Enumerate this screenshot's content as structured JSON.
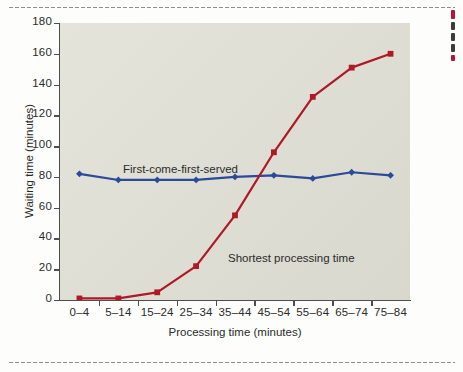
{
  "figure": {
    "plot_bg_color": "#dfdfd4",
    "page_bg_color": "#fdfdfb",
    "axis_color": "#4d4d4d"
  },
  "chart_data": {
    "type": "line",
    "title": "",
    "xlabel": "Processing time (minutes)",
    "ylabel": "Waiting time (minutes)",
    "categories": [
      "0–4",
      "5–14",
      "15–24",
      "25–34",
      "35–44",
      "45–54",
      "55–64",
      "65–74",
      "75–84"
    ],
    "yticks": [
      0,
      20,
      40,
      60,
      80,
      100,
      120,
      140,
      160,
      180
    ],
    "ylim": [
      0,
      180
    ],
    "grid": false,
    "legend_position": "inline-annotations",
    "series": [
      {
        "name": "First-come-first-served",
        "color": "#2a4a9a",
        "marker": "diamond",
        "values": [
          82,
          78,
          78,
          78,
          80,
          81,
          79,
          83,
          81
        ]
      },
      {
        "name": "Shortest processing time",
        "color": "#b01828",
        "marker": "square",
        "values": [
          1,
          1,
          5,
          22,
          55,
          96,
          132,
          151,
          160
        ]
      }
    ],
    "annotations": [
      {
        "text": "First-come-first-served",
        "series": "First-come-first-served"
      },
      {
        "text": "Shortest processing time",
        "series": "Shortest processing time"
      }
    ]
  }
}
